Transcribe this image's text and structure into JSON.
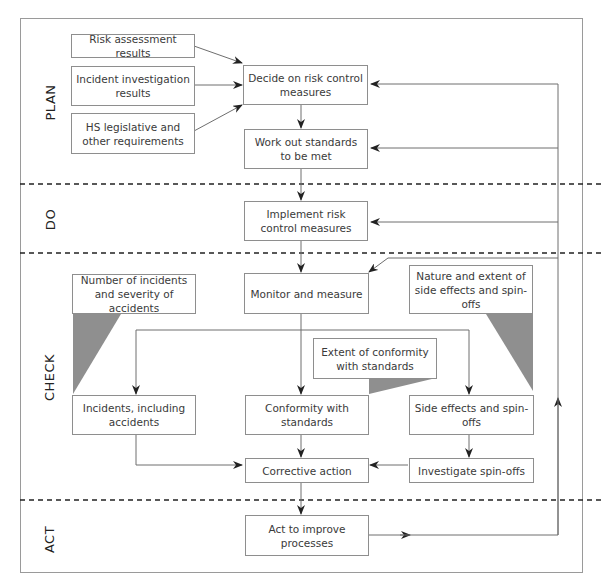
{
  "diagram": {
    "phases": [
      {
        "id": "plan",
        "label": "PLAN"
      },
      {
        "id": "do",
        "label": "DO"
      },
      {
        "id": "check",
        "label": "CHECK"
      },
      {
        "id": "act",
        "label": "ACT"
      }
    ],
    "nodes": {
      "risk_assessment": "Risk assessment results",
      "incident_investigation": "Incident investigation results",
      "hs_legislative": "HS legislative and other requirements",
      "decide_controls": "Decide on risk control measures",
      "work_out_standards": "Work out standards to be met",
      "implement_controls": "Implement risk control measures",
      "monitor_measure": "Monitor and measure",
      "num_incidents": "Number of incidents and severity of accidents",
      "nature_side_effects": "Nature and extent of side effects and spin-offs",
      "extent_conformity": "Extent of conformity with standards",
      "incidents_accidents": "Incidents, including accidents",
      "conformity_standards": "Conformity with standards",
      "side_effects": "Side effects and spin-offs",
      "investigate_spinoffs": "Investigate spin-offs",
      "corrective_action": "Corrective action",
      "act_improve": "Act to improve processes"
    },
    "edges": [
      {
        "from": "risk_assessment",
        "to": "decide_controls"
      },
      {
        "from": "incident_investigation",
        "to": "decide_controls"
      },
      {
        "from": "hs_legislative",
        "to": "decide_controls"
      },
      {
        "from": "decide_controls",
        "to": "work_out_standards"
      },
      {
        "from": "work_out_standards",
        "to": "implement_controls"
      },
      {
        "from": "implement_controls",
        "to": "monitor_measure"
      },
      {
        "from": "monitor_measure",
        "to": "incidents_accidents"
      },
      {
        "from": "monitor_measure",
        "to": "conformity_standards"
      },
      {
        "from": "monitor_measure",
        "to": "side_effects"
      },
      {
        "from": "incidents_accidents",
        "to": "corrective_action"
      },
      {
        "from": "conformity_standards",
        "to": "corrective_action"
      },
      {
        "from": "side_effects",
        "to": "investigate_spinoffs"
      },
      {
        "from": "investigate_spinoffs",
        "to": "corrective_action"
      },
      {
        "from": "corrective_action",
        "to": "act_improve"
      },
      {
        "from": "act_improve",
        "to": "decide_controls",
        "via": "feedback loop"
      },
      {
        "from": "act_improve",
        "to": "work_out_standards",
        "via": "feedback loop"
      },
      {
        "from": "act_improve",
        "to": "implement_controls",
        "via": "feedback loop"
      },
      {
        "from": "act_improve",
        "to": "monitor_measure",
        "via": "feedback loop"
      }
    ],
    "colors": {
      "border": "#8e8e8e",
      "line": "#6e6e6e",
      "callout_fill": "#8f8f8f",
      "text": "#3a3a3a"
    }
  }
}
